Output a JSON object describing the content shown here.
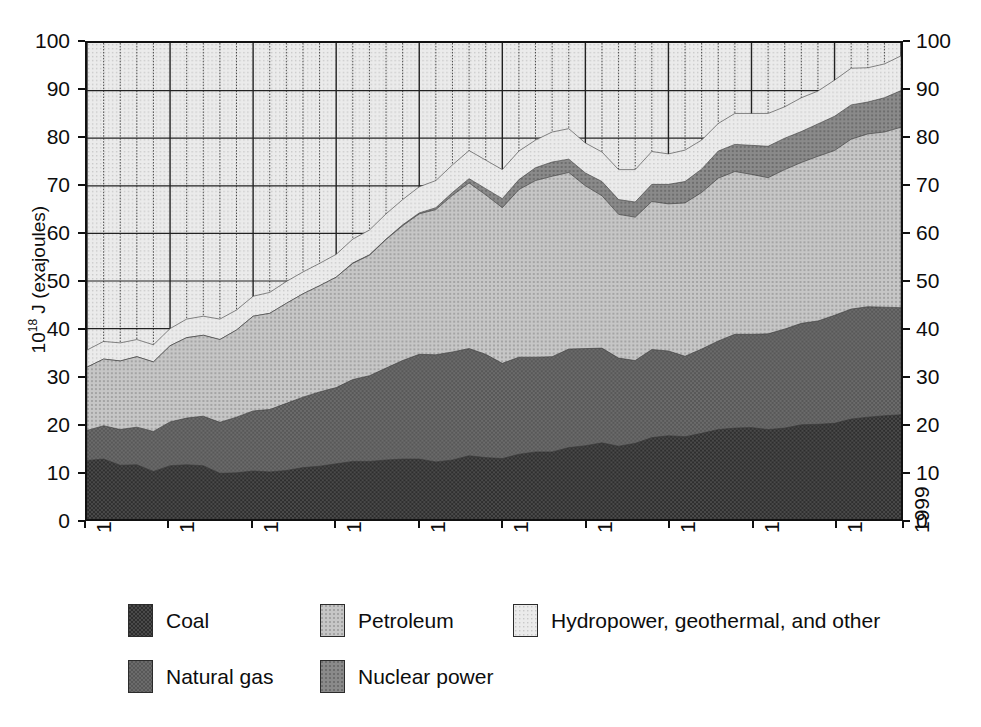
{
  "chart_data": {
    "type": "area",
    "stacked": true,
    "title": "",
    "xlabel": "",
    "ylabel": "10^18 J (exajoules)",
    "ylabel_parts": {
      "base": "10",
      "exponent": "18",
      "rest": " J (exajoules)"
    },
    "ylim": [
      0,
      100
    ],
    "xlim": [
      1950,
      1999
    ],
    "grid": true,
    "grid_major_x_step": 5,
    "grid_minor_x_step": 1,
    "grid_y_step": 10,
    "legend_position": "bottom",
    "x_tick_labels": [
      "1950",
      "1955",
      "1960",
      "1965",
      "1970",
      "1975",
      "1980",
      "1985",
      "1990",
      "1995",
      "1999"
    ],
    "x_tick_values": [
      1950,
      1955,
      1960,
      1965,
      1970,
      1975,
      1980,
      1985,
      1990,
      1995,
      1999
    ],
    "y_tick_labels": [
      "0",
      "10",
      "20",
      "30",
      "40",
      "50",
      "60",
      "70",
      "80",
      "90",
      "100"
    ],
    "y_tick_values": [
      0,
      10,
      20,
      30,
      40,
      50,
      60,
      70,
      80,
      90,
      100
    ],
    "y_axis_both_sides": true,
    "x": [
      1950,
      1951,
      1952,
      1953,
      1954,
      1955,
      1956,
      1957,
      1958,
      1959,
      1960,
      1961,
      1962,
      1963,
      1964,
      1965,
      1966,
      1967,
      1968,
      1969,
      1970,
      1971,
      1972,
      1973,
      1974,
      1975,
      1976,
      1977,
      1978,
      1979,
      1980,
      1981,
      1982,
      1983,
      1984,
      1985,
      1986,
      1987,
      1988,
      1989,
      1990,
      1991,
      1992,
      1993,
      1994,
      1995,
      1996,
      1997,
      1998,
      1999
    ],
    "series": [
      {
        "name": "Coal",
        "color": "#3a3a3a",
        "pattern": "dense-crosshatch",
        "values": [
          12.3,
          12.6,
          11.3,
          11.4,
          10.0,
          11.2,
          11.4,
          11.2,
          9.6,
          9.7,
          10.1,
          9.9,
          10.2,
          10.8,
          11.1,
          11.6,
          12.1,
          12.1,
          12.4,
          12.6,
          12.6,
          12.0,
          12.4,
          13.3,
          12.9,
          12.7,
          13.6,
          14.1,
          14.1,
          15.0,
          15.4,
          16.0,
          15.3,
          15.9,
          17.1,
          17.5,
          17.3,
          18.0,
          18.8,
          19.1,
          19.2,
          18.8,
          19.1,
          19.8,
          19.9,
          20.1,
          21.0,
          21.4,
          21.7,
          21.9
        ]
      },
      {
        "name": "Natural gas",
        "color": "#5d5d5d",
        "pattern": "medium-crosshatch",
        "values": [
          6.3,
          7.0,
          7.5,
          7.9,
          8.4,
          9.2,
          9.8,
          10.4,
          10.7,
          11.7,
          12.6,
          13.1,
          14.1,
          14.8,
          15.6,
          16.0,
          17.2,
          18.0,
          19.3,
          20.7,
          22.0,
          22.5,
          22.7,
          22.5,
          21.7,
          20.0,
          20.4,
          19.9,
          20.0,
          20.7,
          20.4,
          19.9,
          18.5,
          17.4,
          18.5,
          17.8,
          16.9,
          17.7,
          18.6,
          19.7,
          19.6,
          20.1,
          20.8,
          21.3,
          21.7,
          22.7,
          23.1,
          23.2,
          22.8,
          22.5
        ]
      },
      {
        "name": "Petroleum",
        "color": "#b4b4b4",
        "pattern": "fine-check",
        "values": [
          13.3,
          14.0,
          14.4,
          14.8,
          14.6,
          16.0,
          16.9,
          17.0,
          17.4,
          18.3,
          19.9,
          20.2,
          21.0,
          21.7,
          22.3,
          23.2,
          24.4,
          25.3,
          27.0,
          28.3,
          29.5,
          30.5,
          32.9,
          34.8,
          33.5,
          32.7,
          35.2,
          37.1,
          37.9,
          37.1,
          34.2,
          32.0,
          30.2,
          30.1,
          31.1,
          30.9,
          32.2,
          32.9,
          34.2,
          34.2,
          33.6,
          32.8,
          33.5,
          33.8,
          34.6,
          34.6,
          35.7,
          36.3,
          36.8,
          37.9
        ]
      },
      {
        "name": "Nuclear power",
        "color": "#7c7c7c",
        "pattern": "medium-dot",
        "values": [
          0.0,
          0.0,
          0.0,
          0.0,
          0.0,
          0.0,
          0.0,
          0.0,
          0.0,
          0.0,
          0.0,
          0.0,
          0.0,
          0.0,
          0.0,
          0.0,
          0.1,
          0.1,
          0.1,
          0.2,
          0.2,
          0.4,
          0.6,
          0.9,
          1.3,
          1.9,
          2.1,
          2.7,
          3.0,
          2.8,
          2.7,
          3.0,
          3.1,
          3.2,
          3.6,
          4.1,
          4.5,
          4.9,
          5.7,
          5.7,
          6.1,
          6.6,
          6.6,
          6.5,
          6.8,
          7.2,
          7.2,
          6.7,
          7.2,
          7.7
        ]
      },
      {
        "name": "Hydropower, geothermal, and other",
        "color": "#dedede",
        "pattern": "fine-dot",
        "values": [
          3.6,
          3.7,
          3.8,
          3.6,
          3.6,
          3.6,
          3.9,
          4.0,
          4.3,
          4.2,
          4.2,
          4.4,
          4.6,
          4.6,
          4.7,
          4.8,
          5.0,
          5.2,
          5.3,
          5.3,
          5.5,
          5.7,
          5.8,
          5.9,
          6.0,
          6.1,
          6.0,
          5.8,
          6.3,
          6.4,
          6.3,
          6.2,
          6.3,
          6.8,
          6.9,
          6.4,
          6.6,
          6.1,
          5.8,
          6.5,
          6.7,
          6.9,
          6.6,
          7.1,
          6.9,
          7.6,
          7.7,
          7.2,
          7.1,
          7.3
        ]
      }
    ]
  },
  "legend": {
    "rows": [
      [
        {
          "label": "Coal",
          "key": "coal"
        },
        {
          "label": "Petroleum",
          "key": "petroleum"
        },
        {
          "label": "Hydropower, geothermal, and other",
          "key": "hydro"
        }
      ],
      [
        {
          "label": "Natural gas",
          "key": "natural-gas"
        },
        {
          "label": "Nuclear power",
          "key": "nuclear"
        }
      ]
    ]
  }
}
